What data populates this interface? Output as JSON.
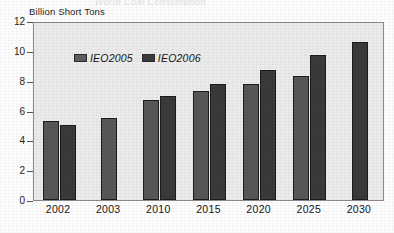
{
  "figure": {
    "cut_title": "World Coal Consumption",
    "y_axis_caption": "Billion Short Tons"
  },
  "legend": {
    "items": [
      {
        "label": "IEO2005",
        "swatch": "legend-swatch-ieo2005",
        "color": "#5e5e5e"
      },
      {
        "label": "IEO2006",
        "swatch": "legend-swatch-ieo2006",
        "color": "#3b3b3b"
      }
    ]
  },
  "chart_data": {
    "type": "bar",
    "title": "World Coal Consumption",
    "xlabel": "",
    "ylabel": "Billion Short Tons",
    "ylim": [
      0,
      12
    ],
    "yticks": [
      0,
      2,
      4,
      6,
      8,
      10,
      12
    ],
    "ytick_labels": [
      "0",
      "2",
      "4",
      "6",
      "8",
      "10",
      "12"
    ],
    "grid": false,
    "legend_position": "top-left",
    "categories": [
      "2002",
      "2003",
      "2010",
      "2015",
      "2020",
      "2025",
      "2030"
    ],
    "series": [
      {
        "name": "IEO2005",
        "color": "#5e5e5e",
        "values": [
          5.3,
          5.5,
          6.7,
          7.3,
          7.8,
          8.3,
          null
        ]
      },
      {
        "name": "IEO2006",
        "color": "#3b3b3b",
        "values": [
          5.0,
          null,
          7.0,
          7.8,
          8.7,
          9.7,
          10.6
        ]
      }
    ]
  }
}
